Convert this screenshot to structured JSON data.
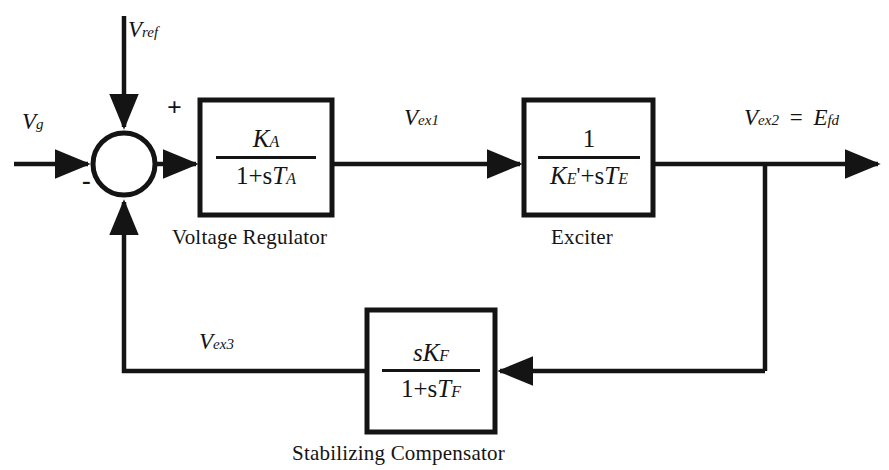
{
  "diagram": {
    "line_color": "#141414",
    "background": "#ffffff",
    "signals": {
      "input_left": "V",
      "input_left_sub": "g",
      "reference": "V",
      "reference_sub": "ref",
      "after_regulator": "V",
      "after_regulator_sub": "ex1",
      "output": "V",
      "output_sub": "ex2",
      "output_equals": "=",
      "output_alias": "E",
      "output_alias_sub": "fd",
      "feedback": "V",
      "feedback_sub": "ex3"
    },
    "summing_junction": {
      "name": "summing-junction",
      "plus_sign": "+",
      "minus_sign": "-",
      "center_x": 124,
      "center_y": 164,
      "radius": 31
    },
    "blocks": [
      {
        "id": "voltage-regulator",
        "caption": "Voltage Regulator",
        "numerator": "K",
        "numerator_sub": "A",
        "denominator_prefix": "1+s",
        "denominator_var": "T",
        "denominator_sub": "A",
        "x": 200,
        "y": 100,
        "w": 132,
        "h": 115
      },
      {
        "id": "exciter",
        "caption": "Exciter",
        "numerator": "1",
        "numerator_sub": "",
        "denominator_prefix": "",
        "denominator_var": "K",
        "denominator_sub": "E",
        "denominator_prime": "'",
        "denominator_mid": "+s",
        "denominator_var2": "T",
        "denominator_sub2": "E",
        "x": 524,
        "y": 100,
        "w": 129,
        "h": 115
      },
      {
        "id": "stabilizing-compensator",
        "caption": "Stabilizing Compensator",
        "numerator_prefix": "s",
        "numerator": "K",
        "numerator_sub": "F",
        "denominator_prefix": "1+s",
        "denominator_var": "T",
        "denominator_sub": "F",
        "x": 367,
        "y": 310,
        "w": 128,
        "h": 122
      }
    ]
  }
}
